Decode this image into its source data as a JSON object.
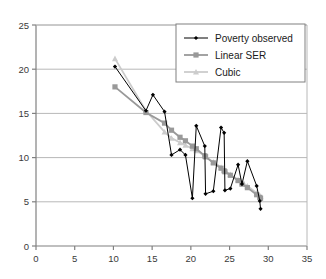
{
  "chart_data": {
    "type": "line",
    "title": "",
    "xlabel": "",
    "ylabel": "",
    "xlim": [
      0,
      35
    ],
    "ylim": [
      0,
      25
    ],
    "xticks": [
      0,
      5,
      10,
      15,
      20,
      25,
      30,
      35
    ],
    "yticks": [
      0,
      5,
      10,
      15,
      20,
      25
    ],
    "grid": "horizontal",
    "legend_position": "top-right",
    "series": [
      {
        "name": "Poverty observed",
        "color": "#000000",
        "marker": "diamond",
        "points": [
          [
            10.2,
            20.3
          ],
          [
            14.2,
            15.3
          ],
          [
            15.1,
            17.1
          ],
          [
            16.6,
            15.2
          ],
          [
            17.5,
            10.3
          ],
          [
            18.6,
            10.9
          ],
          [
            19.3,
            10.3
          ],
          [
            20.2,
            5.4
          ],
          [
            20.7,
            13.6
          ],
          [
            21.8,
            11.3
          ],
          [
            21.9,
            5.9
          ],
          [
            22.9,
            6.2
          ],
          [
            23.9,
            13.4
          ],
          [
            24.3,
            12.8
          ],
          [
            24.4,
            6.3
          ],
          [
            25.1,
            6.5
          ],
          [
            26.1,
            9.2
          ],
          [
            26.6,
            7.0
          ],
          [
            27.3,
            9.6
          ],
          [
            28.5,
            6.8
          ],
          [
            28.9,
            5.1
          ],
          [
            29.0,
            4.2
          ]
        ]
      },
      {
        "name": "Linear SER",
        "color": "#999999",
        "marker": "square",
        "points": [
          [
            10.2,
            18.0
          ],
          [
            14.2,
            15.1
          ],
          [
            16.6,
            13.9
          ],
          [
            17.5,
            13.1
          ],
          [
            18.6,
            12.3
          ],
          [
            19.3,
            11.9
          ],
          [
            20.2,
            11.3
          ],
          [
            20.7,
            11.0
          ],
          [
            21.8,
            10.2
          ],
          [
            21.9,
            10.1
          ],
          [
            22.9,
            9.4
          ],
          [
            23.9,
            8.8
          ],
          [
            24.3,
            8.5
          ],
          [
            24.4,
            8.4
          ],
          [
            25.1,
            8.0
          ],
          [
            26.1,
            7.4
          ],
          [
            26.6,
            7.0
          ],
          [
            27.3,
            6.6
          ],
          [
            28.5,
            5.8
          ],
          [
            28.9,
            5.5
          ],
          [
            29.0,
            5.4
          ]
        ]
      },
      {
        "name": "Cubic",
        "color": "#cccccc",
        "marker": "triangle",
        "points": [
          [
            10.2,
            21.2
          ],
          [
            14.2,
            15.3
          ],
          [
            16.6,
            12.9
          ],
          [
            17.5,
            12.2
          ],
          [
            18.6,
            11.7
          ],
          [
            19.3,
            11.4
          ],
          [
            20.2,
            11.0
          ],
          [
            20.7,
            10.8
          ],
          [
            21.8,
            10.2
          ],
          [
            21.9,
            10.1
          ],
          [
            22.9,
            9.5
          ],
          [
            23.9,
            8.9
          ],
          [
            24.3,
            8.6
          ],
          [
            24.4,
            8.5
          ],
          [
            25.1,
            8.1
          ],
          [
            26.1,
            7.5
          ],
          [
            26.6,
            7.2
          ],
          [
            27.3,
            6.8
          ],
          [
            28.5,
            6.0
          ],
          [
            28.9,
            5.7
          ],
          [
            29.0,
            5.6
          ]
        ]
      }
    ]
  },
  "legend": {
    "items": [
      {
        "label": "Poverty observed"
      },
      {
        "label": "Linear SER"
      },
      {
        "label": "Cubic"
      }
    ]
  },
  "axes": {
    "x_tick_labels": [
      "0",
      "5",
      "10",
      "15",
      "20",
      "25",
      "30",
      "35"
    ],
    "y_tick_labels": [
      "0",
      "5",
      "10",
      "15",
      "20",
      "25"
    ]
  },
  "colors": {
    "observed": "#000000",
    "linear": "#999999",
    "cubic": "#cccccc",
    "grid": "#b8b8b8",
    "axis": "#808080",
    "text": "#3a3a3a"
  }
}
